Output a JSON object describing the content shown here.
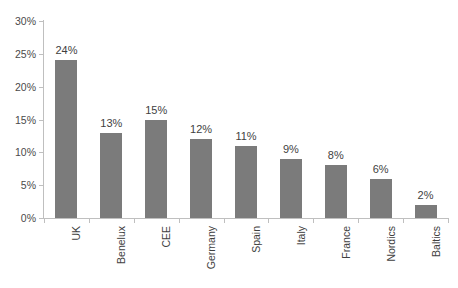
{
  "chart_data": {
    "type": "bar",
    "title": "",
    "xlabel": "",
    "ylabel": "",
    "categories": [
      "UK",
      "Benelux",
      "CEE",
      "Germany",
      "Spain",
      "Italy",
      "France",
      "Nordics",
      "Baltics"
    ],
    "values": [
      24,
      13,
      15,
      12,
      11,
      9,
      8,
      6,
      2
    ],
    "data_labels": [
      "24%",
      "13%",
      "15%",
      "12%",
      "11%",
      "9%",
      "8%",
      "6%",
      "2%"
    ],
    "ylim": [
      0,
      30
    ],
    "ytick_values": [
      0,
      5,
      10,
      15,
      20,
      25,
      30
    ],
    "ytick_labels": [
      "0%",
      "5%",
      "10%",
      "15%",
      "20%",
      "25%",
      "30%"
    ],
    "grid": false,
    "legend": false,
    "bar_color": "#7b7b7b",
    "axis_color": "#bfbfbf",
    "text_color": "#3f3f3f",
    "background": "#ffffff",
    "series": [
      {
        "name": "Share",
        "values": [
          24,
          13,
          15,
          12,
          11,
          9,
          8,
          6,
          2
        ]
      }
    ]
  }
}
